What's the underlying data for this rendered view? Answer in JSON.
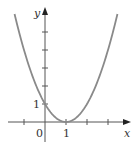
{
  "chart_data": {
    "type": "line",
    "title": "",
    "function": "y = (x - 1)^2",
    "xlabel": "x",
    "ylabel": "y",
    "xlim": [
      -1.7,
      3.9
    ],
    "ylim": [
      -0.6,
      6.8
    ],
    "x_ticks": [
      -1,
      0,
      1,
      2,
      3
    ],
    "y_ticks": [
      1,
      2,
      3,
      4,
      5
    ],
    "x_tick_labels": [
      {
        "value": 0,
        "label": "0"
      },
      {
        "value": 1,
        "label": "1"
      }
    ],
    "y_tick_labels": [
      {
        "value": 1,
        "label": "1"
      }
    ],
    "grid": false,
    "series": [
      {
        "name": "parabola",
        "x_range": [
          -1.45,
          3.45
        ],
        "vertex": [
          1,
          0
        ],
        "y_intercept": 1
      }
    ],
    "colors": {
      "curve": "#8a8a8a",
      "axes": "#555555"
    }
  }
}
